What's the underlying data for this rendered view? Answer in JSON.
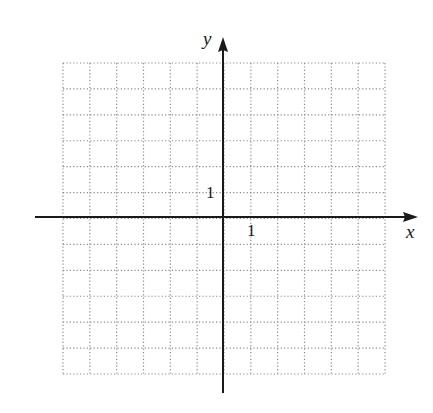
{
  "figure": {
    "type": "coordinate-plane"
  },
  "axes": {
    "x_label": "x",
    "y_label": "y",
    "x_tick_label": "1",
    "y_tick_label": "1",
    "x_range": [
      -7,
      5
    ],
    "y_range": [
      -6,
      6
    ]
  },
  "grid": {
    "columns": 12,
    "rows": 12,
    "style": "dotted",
    "line_color": "#8a8a8a",
    "axis_color": "#1a1a1a"
  },
  "colors": {
    "background": "#ffffff",
    "axis": "#1a1a1a",
    "grid": "#8a8a8a",
    "text": "#1a1a1a"
  }
}
